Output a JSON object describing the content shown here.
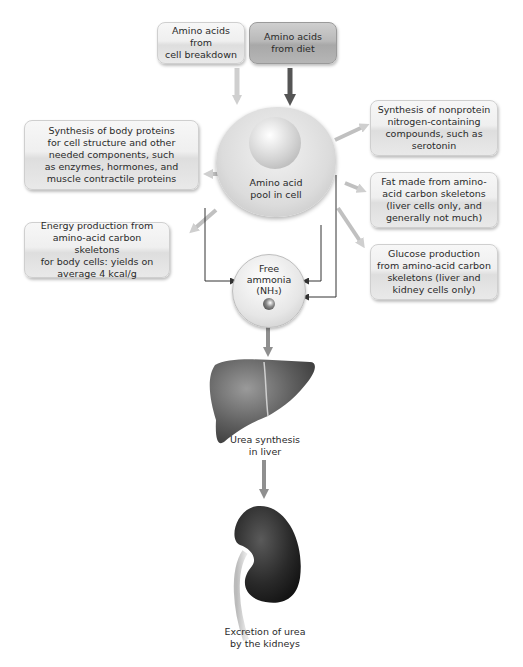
{
  "diagram": {
    "sources": {
      "cell_breakdown": "Amino acids from\ncell breakdown",
      "diet": "Amino acids\nfrom diet"
    },
    "center": {
      "pool": "Amino acid\npool in cell",
      "ammonia_line1": "Free",
      "ammonia_line2": "ammonia",
      "ammonia_line3": "(NH₃)"
    },
    "outputs": {
      "body_proteins": "Synthesis of body proteins\nfor cell structure and other\nneeded components, such\nas enzymes, hormones, and\nmuscle contractile proteins",
      "energy": "Energy production from\namino-acid carbon skeletons\nfor body cells: yields on\naverage 4 kcal/g",
      "nonprotein": "Synthesis of nonprotein\nnitrogen-containing\ncompounds, such as\nserotonin",
      "fat": "Fat made from amino-\nacid carbon skeletons\n(liver cells only, and\ngenerally not much)",
      "glucose": "Glucose production\nfrom amino-acid carbon\nskeletons (liver and\nkidney cells only)"
    },
    "organs": {
      "liver": "Urea synthesis\nin liver",
      "kidney": "Excretion of urea\nby the kidneys"
    },
    "colors": {
      "light_arrow": "#c8c8c8",
      "dark_arrow": "#555555",
      "mid_arrow": "#8f8f8f",
      "connector": "#333333"
    }
  }
}
